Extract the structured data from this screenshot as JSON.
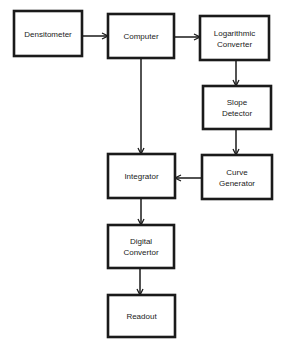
{
  "diagram": {
    "type": "flowchart",
    "colors": {
      "stroke": "#1a1a1a",
      "background": "#ffffff",
      "text": "#222222"
    },
    "nodes": [
      {
        "id": "densitometer",
        "lines": [
          "Densitometer"
        ]
      },
      {
        "id": "computer",
        "lines": [
          "Computer"
        ]
      },
      {
        "id": "log_converter",
        "lines": [
          "Logarithmic",
          "Converter"
        ]
      },
      {
        "id": "slope_detector",
        "lines": [
          "Slope",
          "Detector"
        ]
      },
      {
        "id": "curve_generator",
        "lines": [
          "Curve",
          "Generator"
        ]
      },
      {
        "id": "integrator",
        "lines": [
          "Integrator"
        ]
      },
      {
        "id": "digital_convertor",
        "lines": [
          "Digital",
          "Convertor"
        ]
      },
      {
        "id": "readout",
        "lines": [
          "Readout"
        ]
      }
    ],
    "edges": [
      {
        "from": "densitometer",
        "to": "computer"
      },
      {
        "from": "computer",
        "to": "log_converter"
      },
      {
        "from": "log_converter",
        "to": "slope_detector"
      },
      {
        "from": "slope_detector",
        "to": "curve_generator"
      },
      {
        "from": "curve_generator",
        "to": "integrator"
      },
      {
        "from": "computer",
        "to": "integrator"
      },
      {
        "from": "integrator",
        "to": "digital_convertor"
      },
      {
        "from": "digital_convertor",
        "to": "readout"
      }
    ]
  }
}
